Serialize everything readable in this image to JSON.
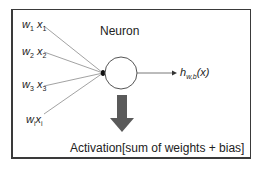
{
  "title": "Neuron",
  "inputs": [
    {
      "w": "w",
      "w_sub": "1",
      "x": "x",
      "x_sub": "1"
    },
    {
      "w": "w",
      "w_sub": "2",
      "x": "x",
      "x_sub": "2"
    },
    {
      "w": "w",
      "w_sub": "3",
      "x": "x",
      "x_sub": "3"
    },
    {
      "w": "w",
      "w_sub": "i",
      "x": "x",
      "x_sub": "i"
    }
  ],
  "output": {
    "h": "h",
    "sub": "w,b",
    "arg": "(x)"
  },
  "activation_label": "Activation[sum of weights + bias]",
  "colors": {
    "border": "#3a3a3a",
    "line": "#8a8a8a",
    "arrow": "#5a5a5a",
    "text": "#222222"
  }
}
